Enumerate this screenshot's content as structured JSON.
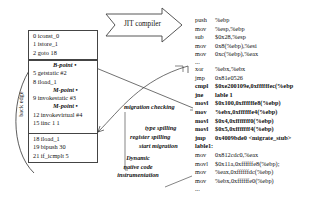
{
  "bytecode": {
    "block1": [
      "0 iconst_0",
      "1 istore_1",
      "2 goto 18"
    ],
    "block2": {
      "b_point": "B-point",
      "lines_a": [
        "5 getstatic #2",
        "8 iload_1"
      ],
      "m_point_1": "M-point",
      "line_b": "9 invokestatic #3",
      "m_point_2": "M-point",
      "lines_c": [
        "12 invokevirtual #4",
        "15 iinc 1 1"
      ]
    },
    "block3": [
      "18 iload_1",
      "19 bipush 30",
      "21 if_icmplt 5"
    ],
    "back_edge_label": "back edge"
  },
  "jit_arrow_label": "JIT compiler",
  "labels": {
    "migration_checking": "migration checking",
    "type_spilling": "type spilling",
    "register_spilling": "register  spilling",
    "start_migration": "start migration",
    "dynamic_instrumentation": [
      "Dynamic",
      "native code",
      "instrumentation"
    ]
  },
  "assembly": [
    {
      "op": "push",
      "arg": "%ebp",
      "bold": false
    },
    {
      "op": "mov",
      "arg": "%esp,%ebp",
      "bold": false
    },
    {
      "op": "sub",
      "arg": "$0x28,%esp",
      "bold": false
    },
    {
      "op": "mov",
      "arg": "0x8(%ebp),%esi",
      "bold": false
    },
    {
      "op": "mov",
      "arg": "0xc(%ebp),%eax",
      "bold": false
    },
    {
      "op": "...",
      "arg": "",
      "bold": false
    },
    {
      "op": "xor",
      "arg": "%ebx,%ebx",
      "bold": false
    },
    {
      "op": "jmp",
      "arg": "0x81e0526",
      "bold": false
    },
    {
      "op": "cmpl",
      "arg": "$0xe200109e,0xffffffec(%ebp",
      "bold": true
    },
    {
      "op": "jne",
      "arg": "lable 1",
      "bold": true
    },
    {
      "op": "movl",
      "arg": "$0x100,0xffffffe8(%ebp)",
      "bold": true
    },
    {
      "op": "mov",
      "arg": "%ebx,0xffffffe4(%ebp)",
      "bold": true
    },
    {
      "op": "movl",
      "arg": "$0x4,0xfffffff0(%ebp)",
      "bold": true
    },
    {
      "op": "movl",
      "arg": "$0x5,0xfffffff4(%ebp)",
      "bold": true
    },
    {
      "op": "jmp",
      "arg": "0x4009bde0 <migrate_stub>",
      "bold": true
    },
    {
      "op": "lable1:",
      "arg": "",
      "bold": true
    },
    {
      "op": "mov",
      "arg": "0x812cdc0,%eax",
      "bold": false
    },
    {
      "op": "movl",
      "arg": "$0x11a,0xffffffe8(%ebp);",
      "bold": false
    },
    {
      "op": "mov",
      "arg": "%eax,0xffffffdc(%ebp)",
      "bold": false
    },
    {
      "op": "mov",
      "arg": "%ebx,0xffffffe0(%ebp)",
      "bold": false
    },
    {
      "op": "...",
      "arg": "",
      "bold": false
    }
  ]
}
